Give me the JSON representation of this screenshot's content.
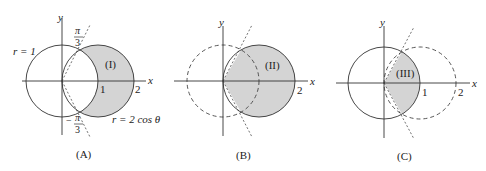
{
  "panels": [
    {
      "id": "A",
      "caption": "(A)",
      "region_label": "(I)",
      "axis_x": "x",
      "axis_y": "y",
      "tick_1": "1",
      "tick_2": "2",
      "label_unit_circle": "r = 1",
      "label_cos_circle": "r = 2 cos θ",
      "angle_top_num": "π",
      "angle_top_den": "3",
      "angle_bottom_sign": "−",
      "angle_bottom_num": "π",
      "angle_bottom_den": "3"
    },
    {
      "id": "B",
      "caption": "(B)",
      "region_label": "(II)",
      "axis_x": "x",
      "axis_y": "y",
      "tick_2": "2"
    },
    {
      "id": "C",
      "caption": "(C)",
      "region_label": "(III)",
      "axis_x": "x",
      "axis_y": "y",
      "tick_1": "1",
      "tick_2": "2"
    }
  ],
  "colors": {
    "shade": "#d4d4d4",
    "stroke": "#333333"
  }
}
